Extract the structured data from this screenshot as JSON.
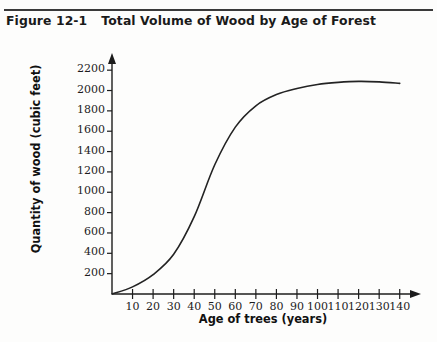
{
  "figure": {
    "number_label": "Figure 12-1",
    "caption": "Total Volume of Wood by Age of Forest"
  },
  "chart_data": {
    "type": "line",
    "title": "Total Volume of Wood by Age of Forest",
    "xlabel": "Age of trees (years)",
    "ylabel": "Quantity of wood (cubic feet)",
    "xlim": [
      0,
      145
    ],
    "ylim": [
      0,
      2300
    ],
    "grid": false,
    "legend": false,
    "x_ticks": [
      10,
      20,
      30,
      40,
      50,
      60,
      70,
      80,
      90,
      100,
      110,
      120,
      130,
      140
    ],
    "y_ticks": [
      200,
      400,
      600,
      800,
      1000,
      1200,
      1400,
      1600,
      1800,
      2000,
      2200
    ],
    "series": [
      {
        "name": "Total volume of wood",
        "x": [
          0,
          10,
          20,
          30,
          40,
          50,
          60,
          70,
          80,
          90,
          100,
          110,
          120,
          130,
          140
        ],
        "values": [
          0,
          70,
          190,
          390,
          760,
          1270,
          1640,
          1850,
          1960,
          2020,
          2060,
          2080,
          2090,
          2085,
          2070
        ]
      }
    ]
  }
}
